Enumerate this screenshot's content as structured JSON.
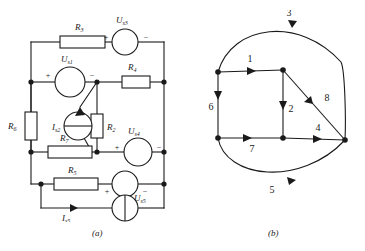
{
  "figure": {
    "panels": [
      {
        "id": "a",
        "caption": "(a)",
        "type": "circuit"
      },
      {
        "id": "b",
        "caption": "(b)",
        "type": "graph"
      }
    ]
  },
  "circuit": {
    "components": [
      {
        "name": "R3",
        "label": "R",
        "sub": "3",
        "kind": "resistor",
        "orient": "h"
      },
      {
        "name": "Us3",
        "label": "U",
        "sub": "s3",
        "kind": "voltage-source",
        "plus": "+",
        "minus": "−"
      },
      {
        "name": "Us1",
        "label": "U",
        "sub": "s1",
        "kind": "voltage-source",
        "plus": "+",
        "minus": "−"
      },
      {
        "name": "R4",
        "label": "R",
        "sub": "4",
        "kind": "resistor",
        "orient": "h"
      },
      {
        "name": "R6",
        "label": "R",
        "sub": "6",
        "kind": "resistor",
        "orient": "v"
      },
      {
        "name": "Is2",
        "label": "I",
        "sub": "s2",
        "kind": "current-source"
      },
      {
        "name": "R2",
        "label": "R",
        "sub": "2",
        "kind": "resistor",
        "orient": "v"
      },
      {
        "name": "R7",
        "label": "R",
        "sub": "7",
        "kind": "resistor",
        "orient": "h"
      },
      {
        "name": "Us4",
        "label": "U",
        "sub": "s4",
        "kind": "voltage-source",
        "plus": "+",
        "minus": "−"
      },
      {
        "name": "R5",
        "label": "R",
        "sub": "5",
        "kind": "resistor",
        "orient": "h"
      },
      {
        "name": "Us5",
        "label": "U",
        "sub": "s5",
        "kind": "voltage-source",
        "plus": "+",
        "minus": "−"
      },
      {
        "name": "Is5",
        "label": "I",
        "sub": "s5",
        "kind": "current-source"
      }
    ],
    "signs": {
      "plus": "+",
      "minus": "−"
    }
  },
  "graph": {
    "nodes": [
      {
        "id": "n1",
        "x": 218,
        "y": 72
      },
      {
        "id": "n2",
        "x": 283,
        "y": 70
      },
      {
        "id": "n3",
        "x": 218,
        "y": 138
      },
      {
        "id": "n4",
        "x": 283,
        "y": 138
      },
      {
        "id": "n5",
        "x": 345,
        "y": 140
      }
    ],
    "branches": [
      {
        "id": "1",
        "label": "1"
      },
      {
        "id": "2",
        "label": "2"
      },
      {
        "id": "3",
        "label": "3"
      },
      {
        "id": "4",
        "label": "4"
      },
      {
        "id": "5",
        "label": "5"
      },
      {
        "id": "6",
        "label": "6"
      },
      {
        "id": "7",
        "label": "7"
      },
      {
        "id": "8",
        "label": "8"
      }
    ]
  }
}
